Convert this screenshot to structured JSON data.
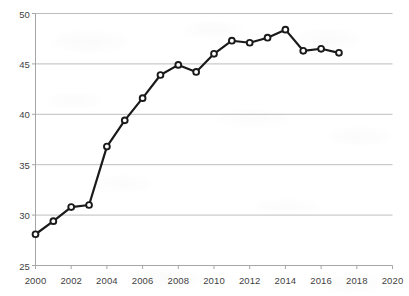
{
  "chart_data": {
    "type": "line",
    "title": "",
    "subtitle": "",
    "xlabel": "",
    "ylabel": "",
    "legend": [],
    "legend_position": "none",
    "grid": true,
    "grid_axis": "y",
    "xlim": [
      2000,
      2020
    ],
    "ylim": [
      25,
      50
    ],
    "xticks": [
      2000,
      2002,
      2004,
      2006,
      2008,
      2010,
      2012,
      2014,
      2016,
      2018,
      2020
    ],
    "xtick_labels": [
      "2000",
      "2002",
      "2004",
      "2006",
      "2008",
      "2010",
      "2012",
      "2014",
      "2016",
      "2018",
      "2020"
    ],
    "yticks": [
      25,
      30,
      35,
      40,
      45,
      50
    ],
    "ytick_labels": [
      "25",
      "30",
      "35",
      "40",
      "45",
      "50"
    ],
    "x": [
      2000,
      2001,
      2002,
      2003,
      2004,
      2005,
      2006,
      2007,
      2008,
      2009,
      2010,
      2011,
      2012,
      2013,
      2014,
      2015,
      2016,
      2017
    ],
    "values": [
      28.1,
      29.4,
      30.8,
      31.0,
      36.8,
      39.4,
      41.6,
      43.9,
      44.9,
      44.2,
      46.0,
      47.3,
      47.1,
      47.6,
      48.4,
      46.3,
      46.5,
      46.1
    ],
    "series": [
      {
        "name": "series-1",
        "color": "#1a1a1a",
        "marker": "circle-open",
        "line_width": 2.2,
        "values": [
          28.1,
          29.4,
          30.8,
          31.0,
          36.8,
          39.4,
          41.6,
          43.9,
          44.9,
          44.2,
          46.0,
          47.3,
          47.1,
          47.6,
          48.4,
          46.3,
          46.5,
          46.1
        ]
      }
    ],
    "annotations": []
  },
  "style": {
    "background": "#ffffff",
    "grid_color": "#b7b7b7",
    "axis_color": "#a6a6a6",
    "tick_text_color": "#3f3f3f",
    "line_color": "#1a1a1a",
    "marker_fill": "#ffffff",
    "marker_edge": "#1a1a1a"
  }
}
